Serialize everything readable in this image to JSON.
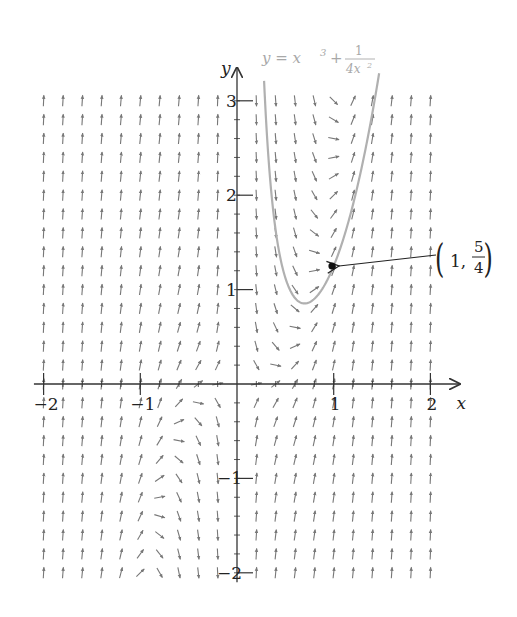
{
  "chart_data": {
    "type": "slope-field",
    "title": "",
    "differential_equation": "dy/dx = 5x^2 - 2y/x",
    "field_params": {
      "a": 5,
      "b": -2
    },
    "xlabel": "x",
    "ylabel": "y",
    "xlim": [
      -2.1,
      2.3
    ],
    "ylim": [
      -2.1,
      3.35
    ],
    "x_ticks": [
      -2,
      -1,
      1,
      2
    ],
    "x_tick_labels": [
      "−2",
      "−1",
      "1",
      "2"
    ],
    "y_ticks": [
      -2,
      -1,
      1,
      2,
      3
    ],
    "y_tick_labels": [
      "−2",
      "−1",
      "1",
      "2",
      "3"
    ],
    "grid_step": 0.2,
    "grid_x_range": [
      -2,
      2
    ],
    "grid_y_range": [
      -2,
      3
    ],
    "grid": false,
    "solution_curve": {
      "equation_label": "y = x^3 + 1/(4x^2)",
      "x_range": [
        0.28,
        1.47
      ],
      "color": "#b0b0b0"
    },
    "annotations": [
      {
        "text": "(1, 5/4)",
        "x": 1,
        "y": 1.25,
        "type": "point-with-arrow"
      }
    ]
  },
  "labels": {
    "x_axis": "x",
    "y_axis": "y",
    "curve_lhs": "y = x",
    "curve_exp": "3",
    "curve_plus": "+",
    "curve_num": "1",
    "curve_den": "4x",
    "curve_den_exp": "2",
    "point_one": "1,",
    "point_num": "5",
    "point_den": "4"
  },
  "colors": {
    "axis": "#333333",
    "arrows": "#777777",
    "curve": "#b0b0b0",
    "point": "#111111"
  }
}
